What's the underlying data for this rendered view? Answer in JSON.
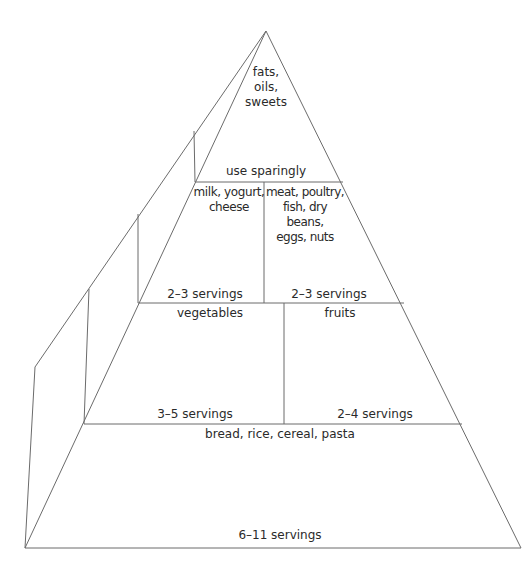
{
  "pyramid": {
    "title": "Food Guide Pyramid",
    "tiers": [
      {
        "name": "top",
        "groups": [
          {
            "label": "fats,\noils,\nsweets",
            "servings": "use sparingly"
          }
        ]
      },
      {
        "name": "second",
        "groups": [
          {
            "label": "milk, yogurt,\ncheese",
            "servings": "2–3 servings"
          },
          {
            "label": "meat, poultry,\nfish, dry beans,\neggs, nuts",
            "servings": "2–3 servings"
          }
        ]
      },
      {
        "name": "third",
        "groups": [
          {
            "label": "vegetables",
            "servings": "3–5 servings"
          },
          {
            "label": "fruits",
            "servings": "2–4 servings"
          }
        ]
      },
      {
        "name": "base",
        "groups": [
          {
            "label": "bread, rice, cereal, pasta",
            "servings": "6–11 servings"
          }
        ]
      }
    ],
    "line_color": "#6b6b6b"
  }
}
